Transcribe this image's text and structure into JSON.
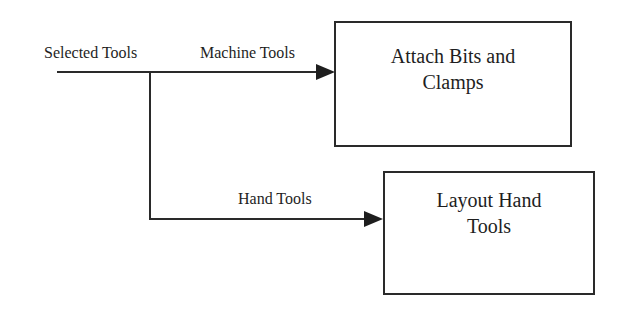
{
  "diagram": {
    "input_label": "Selected Tools",
    "edges": [
      {
        "label": "Machine Tools",
        "target": "Attach Bits and Clamps"
      },
      {
        "label": "Hand Tools",
        "target": "Layout Hand Tools"
      }
    ],
    "nodes": [
      {
        "id": "attach",
        "lines": [
          "Attach Bits and",
          "Clamps"
        ]
      },
      {
        "id": "layout",
        "lines": [
          "Layout Hand",
          "Tools"
        ]
      }
    ],
    "colors": {
      "stroke": "#2a2a2a",
      "text": "#1e1e1e",
      "background": "#ffffff"
    }
  }
}
